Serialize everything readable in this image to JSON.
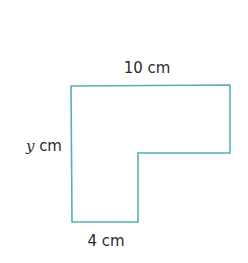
{
  "diagram": {
    "shape": "L-shape",
    "stroke_color": "#5aaeb8",
    "labels": {
      "top": "10 cm",
      "left_var": "y",
      "left_unit": " cm",
      "bottom": "4 cm"
    },
    "points": "71,86 230,85 230,153 138,153 138,222 72,222"
  }
}
